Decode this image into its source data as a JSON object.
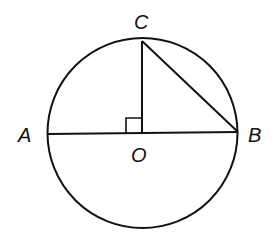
{
  "diagram": {
    "type": "circle-geometry",
    "stroke_color": "#111111",
    "background": "#ffffff",
    "circle": {
      "center": "O",
      "cx": 142,
      "cy": 133,
      "r": 94
    },
    "points": {
      "A": {
        "label": "A",
        "x": 48,
        "y": 134
      },
      "B": {
        "label": "B",
        "x": 238,
        "y": 132
      },
      "C": {
        "label": "C",
        "x": 142,
        "y": 41
      },
      "O": {
        "label": "O",
        "x": 142,
        "y": 133
      }
    },
    "segments": [
      "AB",
      "OC",
      "CB"
    ],
    "right_angle_at": "O"
  }
}
